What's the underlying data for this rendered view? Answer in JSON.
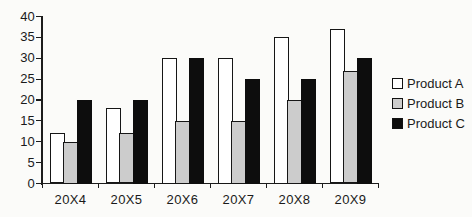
{
  "chart_data": {
    "type": "bar",
    "title": "",
    "xlabel": "",
    "ylabel": "",
    "categories": [
      "20X4",
      "20X5",
      "20X6",
      "20X7",
      "20X8",
      "20X9"
    ],
    "series": [
      {
        "name": "Product A",
        "color": "#ffffff",
        "values": [
          12,
          18,
          30,
          30,
          35,
          37
        ]
      },
      {
        "name": "Product B",
        "color": "#cccccc",
        "values": [
          10,
          12,
          15,
          15,
          20,
          27
        ]
      },
      {
        "name": "Product C",
        "color": "#0d0d0d",
        "values": [
          20,
          20,
          30,
          25,
          25,
          30
        ]
      }
    ],
    "ylim": [
      0,
      40
    ],
    "yticks": [
      0,
      5,
      10,
      15,
      20,
      25,
      30,
      35,
      40
    ],
    "grid": false,
    "legend_position": "right",
    "axis_color": "#1c1c1c",
    "bar_outline_color": "#161616",
    "text_color": "#1a1a1a"
  }
}
